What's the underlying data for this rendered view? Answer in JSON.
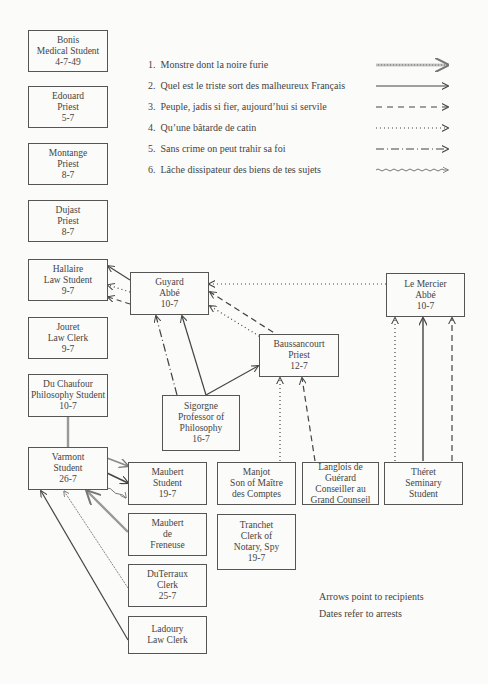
{
  "legend": {
    "items": [
      {
        "num": "1.",
        "label": "Monstre dont la noire furie",
        "style": "double-hatched"
      },
      {
        "num": "2.",
        "label": "Quel est le triste sort des malheureux Français",
        "style": "solid"
      },
      {
        "num": "3.",
        "label": "Peuple, jadis si fier, aujourd’hui si servile",
        "style": "dashed"
      },
      {
        "num": "4.",
        "label": "Qu’une bâtarde de catin",
        "style": "dotted"
      },
      {
        "num": "5.",
        "label": "Sans crime on peut trahir sa foi",
        "style": "dash-dot"
      },
      {
        "num": "6.",
        "label": "Lâche dissipateur des biens de tes sujets",
        "style": "wavy"
      }
    ]
  },
  "nodes": {
    "bonis": {
      "name": "Bonis",
      "role": "Medical Student",
      "date": "4-7-49"
    },
    "edouard": {
      "name": "Edouard",
      "role": "Priest",
      "date": "5-7"
    },
    "montange": {
      "name": "Montange",
      "role": "Priest",
      "date": "8-7"
    },
    "dujast": {
      "name": "Dujast",
      "role": "Priest",
      "date": "8-7"
    },
    "hallaire": {
      "name": "Hallaire",
      "role": "Law Student",
      "date": "9-7"
    },
    "jouret": {
      "name": "Jouret",
      "role": "Law Clerk",
      "date": "9-7"
    },
    "duchaufour": {
      "name": "Du Chaufour",
      "role": "Philosophy Student",
      "date": "10-7"
    },
    "varmont": {
      "name": "Varmont",
      "role": "Student",
      "date": "26-7"
    },
    "guyard": {
      "name": "Guyard",
      "role": "Abbé",
      "date": "10-7"
    },
    "baussancourt": {
      "name": "Baussancourt",
      "role": "Priest",
      "date": "12-7"
    },
    "lemercier": {
      "name": "Le Mercier",
      "role": "Abbé",
      "date": "10-7"
    },
    "sigorgne": {
      "name": "Sigorgne",
      "role": "Professor of",
      "role2": "Philosophy",
      "date": "16-7"
    },
    "maubert": {
      "name": "Maubert",
      "role": "Student",
      "date": "19-7"
    },
    "maubertfreneuse": {
      "name": "Maubert",
      "role": "de",
      "role2": "Freneuse"
    },
    "duterraux": {
      "name": "DuTerraux",
      "role": "Clerk",
      "date": "25-7"
    },
    "ladoury": {
      "name": "Ladoury",
      "role": "Law Clerk"
    },
    "manjot": {
      "name": "Manjot",
      "role": "Son of Maître",
      "role2": "des Comptes"
    },
    "tranchet": {
      "name": "Tranchet",
      "role": "Clerk of",
      "role2": "Notary, Spy",
      "date": "19-7"
    },
    "langlois": {
      "name": "Langlois de Guérard",
      "role": "Conseiller au",
      "role2": "Grand Counseil"
    },
    "theret": {
      "name": "Théret",
      "role": "Seminary",
      "role2": "Student"
    }
  },
  "notes": {
    "line1": "Arrows point to recipients",
    "line2": "Dates refer to arrests"
  },
  "colors": {
    "line": "#444444",
    "hatched": "#888888",
    "background": "#fbfbf9"
  }
}
